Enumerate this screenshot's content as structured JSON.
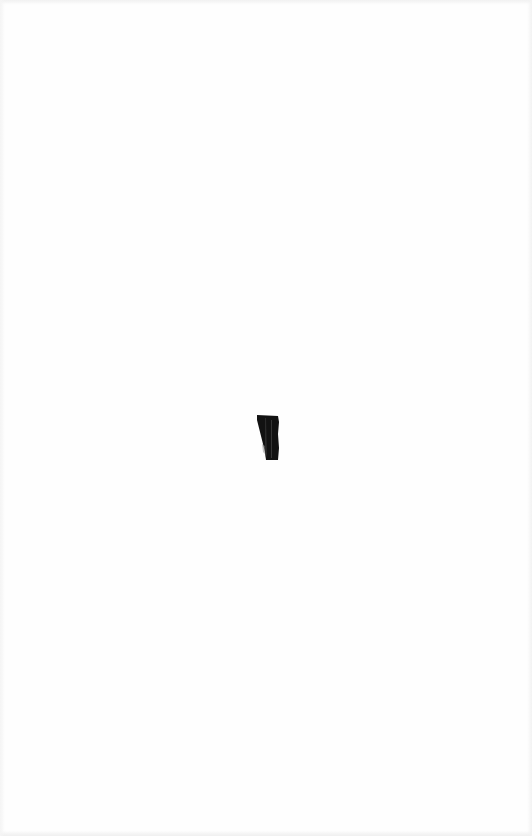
{
  "document": {
    "type": "scanned-page",
    "background_color": "#fefefe",
    "content": "blank page",
    "marks": [
      {
        "name": "ink-mark",
        "x": 256,
        "y": 414,
        "width": 24,
        "height": 48,
        "color": "#111111"
      }
    ]
  }
}
